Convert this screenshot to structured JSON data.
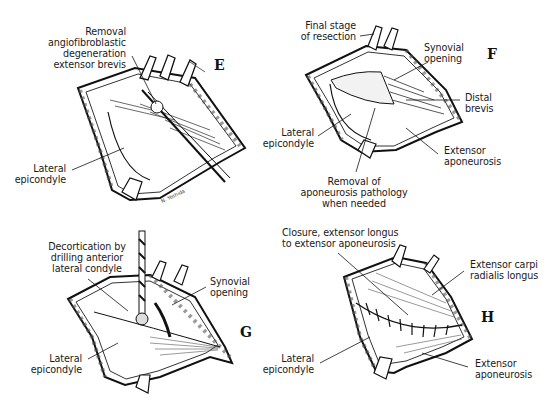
{
  "figure": {
    "panels": [
      {
        "id": "E",
        "letter": "E",
        "labels": {
          "removal": "Removal\nangiofibroblastic\ndegeneration\nextensor brevis",
          "lateral_epicondyle": "Lateral\nepicondyle"
        }
      },
      {
        "id": "F",
        "letter": "F",
        "labels": {
          "final_stage": "Final stage\nof resection",
          "synovial_opening": "Synovial\nopening",
          "distal_brevis": "Distal\nbrevis",
          "lateral_epicondyle": "Lateral\nepicondyle",
          "extensor_aponeurosis": "Extensor\naponeurosis",
          "removal_aponeurosis": "Removal of\naponeurosis pathology\nwhen needed"
        }
      },
      {
        "id": "G",
        "letter": "G",
        "labels": {
          "decortication": "Decortication by\ndrilling anterior\nlateral condyle",
          "synovial_opening": "Synovial\nopening",
          "lateral_epicondyle": "Lateral\nepicondyle"
        }
      },
      {
        "id": "H",
        "letter": "H",
        "labels": {
          "closure": "Closure, extensor longus\nto extensor aponeurosis",
          "ecrl": "Extensor carpi\nradialis longus",
          "lateral_epicondyle": "Lateral\nepicondyle",
          "extensor_aponeurosis": "Extensor\naponeurosis"
        }
      }
    ]
  }
}
